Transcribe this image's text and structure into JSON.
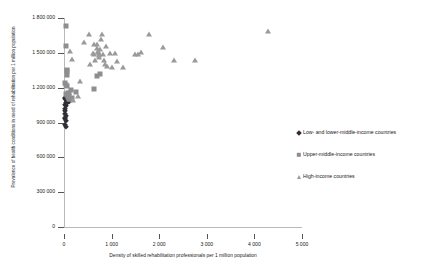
{
  "chart_data": {
    "type": "scatter",
    "title": "",
    "xlabel": "Density of skilled rehabilitation professionals per 1 million population",
    "ylabel": "Prevalence of health conditions in need of rehabilitation per 1 million population",
    "xlim": [
      0,
      5000
    ],
    "ylim": [
      0,
      1800000
    ],
    "xticks": [
      0,
      1000,
      2000,
      3000,
      4000,
      5000
    ],
    "xticklabels": [
      "0",
      "1 000",
      "2 000",
      "3 000",
      "4 000",
      "5 000"
    ],
    "yticks": [
      0,
      300000,
      600000,
      900000,
      1200000,
      1500000,
      1800000
    ],
    "yticklabels": [
      "0",
      "300 000",
      "600 000",
      "900 000",
      "1 200 000",
      "1 500 000",
      "1 800 000"
    ],
    "grid": false,
    "legend_position": "right",
    "series": [
      {
        "name": "Low- and lower-middle-income countries",
        "marker": "diamond",
        "color": "#2f2f33",
        "points": [
          [
            20,
            1110000
          ],
          [
            30,
            1100000
          ],
          [
            45,
            1095000
          ],
          [
            60,
            1085000
          ],
          [
            95,
            1075000
          ],
          [
            120,
            1090000
          ],
          [
            35,
            1040000
          ],
          [
            25,
            1000000
          ],
          [
            30,
            975000
          ],
          [
            40,
            960000
          ],
          [
            28,
            930000
          ],
          [
            35,
            915000
          ],
          [
            30,
            880000
          ],
          [
            45,
            865000
          ],
          [
            22,
            1050000
          ],
          [
            50,
            1065000
          ],
          [
            18,
            940000
          ],
          [
            60,
            1080000
          ],
          [
            15,
            1015000
          ],
          [
            70,
            1070000
          ]
        ]
      },
      {
        "name": "Upper-middle-income countries",
        "marker": "square",
        "color": "#8e8e90",
        "points": [
          [
            45,
            1730000
          ],
          [
            40,
            1560000
          ],
          [
            55,
            1355000
          ],
          [
            70,
            1345000
          ],
          [
            60,
            1310000
          ],
          [
            50,
            1225000
          ],
          [
            65,
            1215000
          ],
          [
            140,
            1180000
          ],
          [
            95,
            1130000
          ],
          [
            60,
            1135000
          ],
          [
            75,
            1120000
          ],
          [
            110,
            1105000
          ],
          [
            250,
            1160000
          ],
          [
            620,
            1190000
          ],
          [
            700,
            1300000
          ],
          [
            760,
            1320000
          ],
          [
            35,
            1145000
          ],
          [
            80,
            1150000
          ],
          [
            105,
            1150000
          ],
          [
            30,
            1240000
          ],
          [
            120,
            1100000
          ],
          [
            160,
            1115000
          ]
        ]
      },
      {
        "name": "High-income countries",
        "marker": "triangle",
        "color": "#9a9a9c",
        "points": [
          [
            130,
            1520000
          ],
          [
            300,
            1130000
          ],
          [
            330,
            1260000
          ],
          [
            420,
            1590000
          ],
          [
            520,
            1660000
          ],
          [
            600,
            1500000
          ],
          [
            640,
            1490000
          ],
          [
            660,
            1440000
          ],
          [
            690,
            1580000
          ],
          [
            700,
            1540000
          ],
          [
            710,
            1505000
          ],
          [
            720,
            1520000
          ],
          [
            730,
            1480000
          ],
          [
            740,
            1460000
          ],
          [
            745,
            1495000
          ],
          [
            760,
            1530000
          ],
          [
            780,
            1620000
          ],
          [
            800,
            1660000
          ],
          [
            820,
            1490000
          ],
          [
            840,
            1440000
          ],
          [
            860,
            1400000
          ],
          [
            900,
            1390000
          ],
          [
            960,
            1500000
          ],
          [
            1000,
            1380000
          ],
          [
            1080,
            1500000
          ],
          [
            1120,
            1430000
          ],
          [
            1240,
            1380000
          ],
          [
            1500,
            1490000
          ],
          [
            1560,
            1490000
          ],
          [
            1620,
            1510000
          ],
          [
            1780,
            1660000
          ],
          [
            2080,
            1550000
          ],
          [
            2320,
            1440000
          ],
          [
            2760,
            1440000
          ],
          [
            4280,
            1690000
          ],
          [
            190,
            1095000
          ],
          [
            160,
            1450000
          ],
          [
            880,
            1560000
          ],
          [
            540,
            1400000
          ],
          [
            620,
            1580000
          ]
        ]
      }
    ]
  },
  "legend": {
    "items": [
      {
        "label": "Low- and lower-middle-income countries",
        "marker": "dia"
      },
      {
        "label": "Upper-middle-income countries",
        "marker": "sq"
      },
      {
        "label": "High-income countries",
        "marker": "tri"
      }
    ]
  }
}
